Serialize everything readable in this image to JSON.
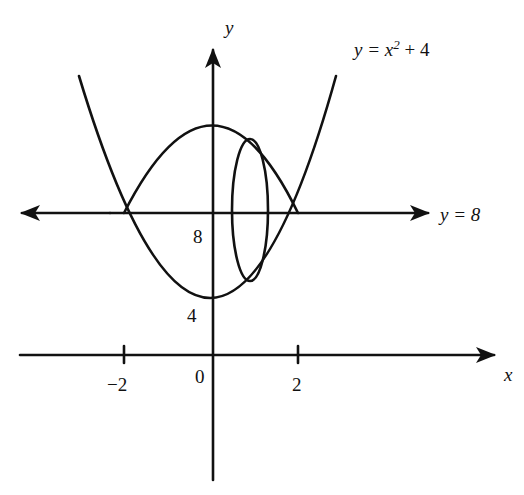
{
  "diagram": {
    "stroke_color": "#111111",
    "background": "#ffffff",
    "axes": {
      "x_label": "x",
      "y_label": "y",
      "x_ticks": [
        {
          "value": -2,
          "label": "−2"
        },
        {
          "value": 0,
          "label": "0"
        },
        {
          "value": 2,
          "label": "2"
        }
      ],
      "y_ticks": [
        {
          "value": 4,
          "label": "4"
        },
        {
          "value": 8,
          "label": "8"
        }
      ]
    },
    "curves": {
      "parabola": {
        "label_prefix": "y = x",
        "label_exponent": "2",
        "label_suffix": " + 4",
        "equation": "y = x^2 + 4",
        "vertex": [
          0,
          4
        ]
      },
      "line": {
        "label": "y = 8",
        "equation": "y = 8"
      },
      "reflected_arc": {
        "description": "Mirror of parabola about y = 8 (upper arc)",
        "top_y": 12
      },
      "cross_section_ellipse": {
        "description": "Vertical elliptical cross-section of solid of revolution about y = 8"
      }
    },
    "intersections": [
      {
        "x": -2,
        "y": 8
      },
      {
        "x": 2,
        "y": 8
      }
    ]
  }
}
